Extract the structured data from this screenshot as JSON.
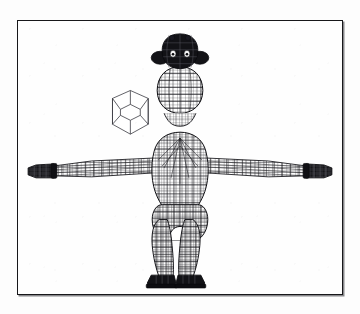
{
  "plate": {
    "background_color": "#fefefe",
    "frame_color": "#17171a",
    "frame_line_width": 1.4,
    "caption": "",
    "title": ""
  },
  "scene": {
    "render_style": "wireframe",
    "line_color": "#141418",
    "fill_color": "#ffffff",
    "dark_fill_color": "#101014",
    "view": "front orthographic",
    "objects": [
      {
        "name": "humanoid-wireframe-model",
        "label": "humanoid wireframe model",
        "pose": "T-pose",
        "parts": [
          "head",
          "ears",
          "neck",
          "torso",
          "left-arm",
          "right-arm",
          "left-hand",
          "right-hand",
          "hips",
          "left-leg",
          "right-leg",
          "left-foot",
          "right-foot"
        ],
        "shaded_parts": [
          "head",
          "ears",
          "left-hand",
          "right-hand",
          "left-foot",
          "right-foot"
        ]
      },
      {
        "name": "dodecahedron-primitive",
        "label": "dodecahedron",
        "faces": 12,
        "silhouette": "hexagonal",
        "position": "left of model, upper area"
      }
    ]
  }
}
